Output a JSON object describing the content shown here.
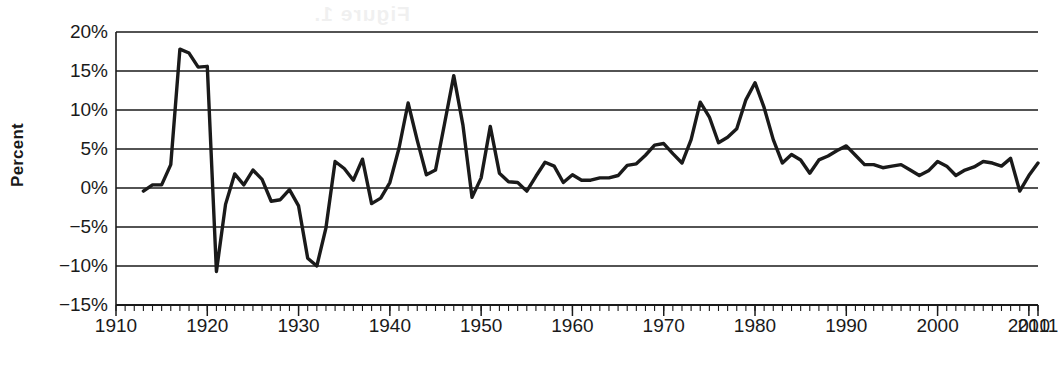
{
  "figure": {
    "y_axis_title": "Percent",
    "x_axis_title": "Year",
    "scan_ghost_text": "Figure 1."
  },
  "chart_data": {
    "type": "line",
    "title": "",
    "xlabel": "Year",
    "ylabel": "Percent",
    "xlim": [
      1910,
      2011
    ],
    "ylim": [
      -15,
      20
    ],
    "grid": "horizontal",
    "legend": "none",
    "line_color": "#1a1a1a",
    "line_width": 3.4,
    "x_ticks": [
      1910,
      1920,
      1930,
      1940,
      1950,
      1960,
      1970,
      1980,
      1990,
      2000,
      2010,
      2011
    ],
    "x_tick_labels": [
      "1910",
      "1920",
      "1930",
      "1940",
      "1950",
      "1960",
      "1970",
      "1980",
      "1990",
      "2000",
      "2010",
      "2011"
    ],
    "x_minor_tick_interval": 1,
    "y_ticks": [
      20,
      15,
      10,
      5,
      0,
      -5,
      -10,
      -15
    ],
    "y_tick_labels": [
      "20%",
      "15%",
      "10%",
      "5%",
      "0%",
      "−5%",
      "−10%",
      "−15%"
    ],
    "series": [
      {
        "name": "Annual inflation rate",
        "x": [
          1913,
          1914,
          1915,
          1916,
          1917,
          1918,
          1919,
          1920,
          1921,
          1922,
          1923,
          1924,
          1925,
          1926,
          1927,
          1928,
          1929,
          1930,
          1931,
          1932,
          1933,
          1934,
          1935,
          1936,
          1937,
          1938,
          1939,
          1940,
          1941,
          1942,
          1943,
          1944,
          1945,
          1946,
          1947,
          1948,
          1949,
          1950,
          1951,
          1952,
          1953,
          1954,
          1955,
          1956,
          1957,
          1958,
          1959,
          1960,
          1961,
          1962,
          1963,
          1964,
          1965,
          1966,
          1967,
          1968,
          1969,
          1970,
          1971,
          1972,
          1973,
          1974,
          1975,
          1976,
          1977,
          1978,
          1979,
          1980,
          1981,
          1982,
          1983,
          1984,
          1985,
          1986,
          1987,
          1988,
          1989,
          1990,
          1991,
          1992,
          1993,
          1994,
          1995,
          1996,
          1997,
          1998,
          1999,
          2000,
          2001,
          2002,
          2003,
          2004,
          2005,
          2006,
          2007,
          2008,
          2009,
          2010,
          2011
        ],
        "y": [
          -0.4,
          0.4,
          0.4,
          3.0,
          17.8,
          17.3,
          15.5,
          15.6,
          -10.7,
          -2.1,
          1.8,
          0.4,
          2.3,
          1.1,
          -1.7,
          -1.5,
          -0.2,
          -2.3,
          -9.0,
          -10.0,
          -5.1,
          3.4,
          2.5,
          1.0,
          3.7,
          -2.0,
          -1.3,
          0.7,
          5.1,
          10.9,
          6.1,
          1.7,
          2.3,
          8.3,
          14.4,
          8.1,
          -1.2,
          1.3,
          7.9,
          1.9,
          0.8,
          0.7,
          -0.4,
          1.5,
          3.3,
          2.8,
          0.7,
          1.7,
          1.0,
          1.0,
          1.3,
          1.3,
          1.6,
          2.9,
          3.1,
          4.2,
          5.5,
          5.7,
          4.4,
          3.2,
          6.2,
          11.0,
          9.1,
          5.8,
          6.5,
          7.6,
          11.3,
          13.5,
          10.3,
          6.2,
          3.2,
          4.3,
          3.6,
          1.9,
          3.6,
          4.1,
          4.8,
          5.4,
          4.2,
          3.0,
          3.0,
          2.6,
          2.8,
          3.0,
          2.3,
          1.6,
          2.2,
          3.4,
          2.8,
          1.6,
          2.3,
          2.7,
          3.4,
          3.2,
          2.8,
          3.8,
          -0.4,
          1.6,
          3.2
        ]
      }
    ],
    "annotations": [
      {
        "label": "WWI inflation peak",
        "x": 1917,
        "y": 17.8
      },
      {
        "label": "Post-WWI deflation",
        "x": 1921,
        "y": -10.7
      },
      {
        "label": "Great Depression deflation",
        "x": 1932,
        "y": -10.0
      },
      {
        "label": "Post-WWII inflation peak",
        "x": 1947,
        "y": 14.4
      },
      {
        "label": "Great Inflation peak",
        "x": 1980,
        "y": 13.5
      },
      {
        "label": "Great Recession deflation",
        "x": 2009,
        "y": -0.4
      }
    ]
  }
}
